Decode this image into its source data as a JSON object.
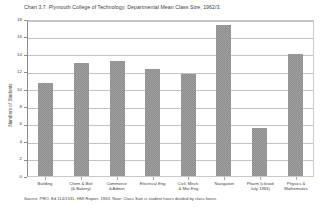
{
  "chart_data": {
    "type": "bar",
    "title": "Chart 3.7. Plymouth College of Technology: Departmental Mean Class Size, 1962/3.",
    "xlabel": "",
    "ylabel": "Numbers of Students",
    "ylim": [
      0,
      18
    ],
    "yticks": [
      0,
      2,
      4,
      6,
      8,
      10,
      12,
      14,
      16,
      18
    ],
    "grid": true,
    "legend": "none",
    "bar_color": "#9a9a9a",
    "categories": [
      "Building",
      "Chem & Biol\n(& Bakery)",
      "Commerce\n& Admin",
      "Electrical Eng",
      "Civil, Mech.\n& Mar Eng",
      "Navigation",
      "Pharm (closed\nJuly 1963)",
      "Physics &\nMathematics"
    ],
    "values": [
      10.7,
      13.0,
      13.2,
      12.3,
      11.7,
      17.3,
      5.5,
      14.0
    ],
    "source_note": "Source: PRO, Ed 114/1531, HMI Report, 1963. Note: Class Size is student hours divided by class hours."
  }
}
